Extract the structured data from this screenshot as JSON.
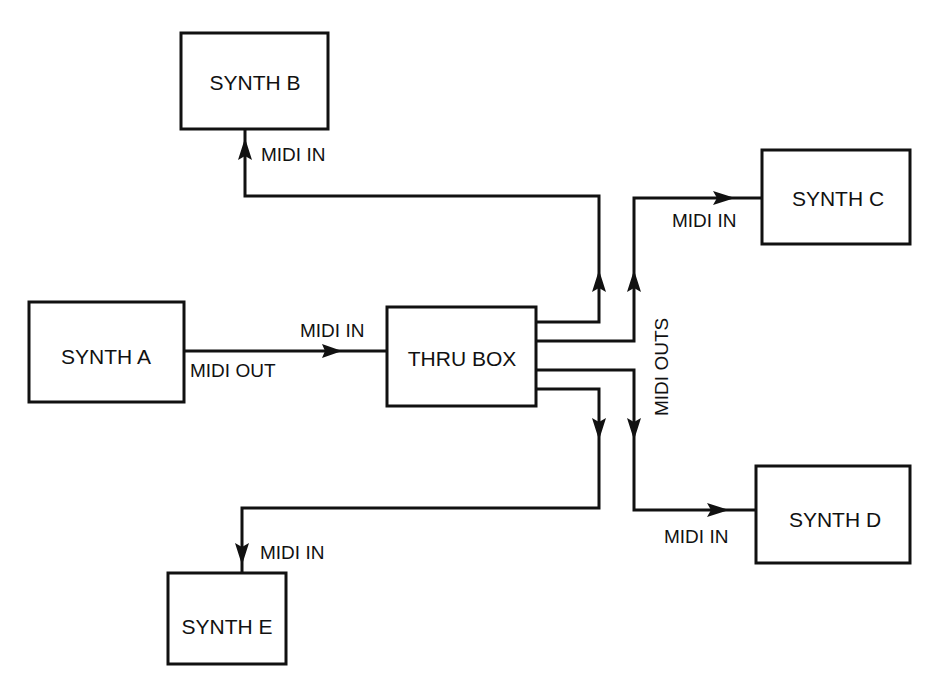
{
  "diagram": {
    "type": "block-diagram",
    "nodes": [
      {
        "id": "synth_a",
        "label": "SYNTH A"
      },
      {
        "id": "synth_b",
        "label": "SYNTH B"
      },
      {
        "id": "synth_c",
        "label": "SYNTH C"
      },
      {
        "id": "synth_d",
        "label": "SYNTH D"
      },
      {
        "id": "synth_e",
        "label": "SYNTH E"
      },
      {
        "id": "thru_box",
        "label": "THRU BOX"
      }
    ],
    "labels": {
      "midi_out": "MIDI OUT",
      "midi_in_thru": "MIDI IN",
      "midi_in_b": "MIDI IN",
      "midi_in_c": "MIDI IN",
      "midi_in_d": "MIDI IN",
      "midi_in_e": "MIDI IN",
      "midi_outs": "MIDI OUTS"
    },
    "edges": [
      {
        "from": "synth_a",
        "to": "thru_box",
        "from_port": "MIDI OUT",
        "to_port": "MIDI IN"
      },
      {
        "from": "thru_box",
        "to": "synth_b",
        "from_port": "MIDI OUTS",
        "to_port": "MIDI IN"
      },
      {
        "from": "thru_box",
        "to": "synth_c",
        "from_port": "MIDI OUTS",
        "to_port": "MIDI IN"
      },
      {
        "from": "thru_box",
        "to": "synth_d",
        "from_port": "MIDI OUTS",
        "to_port": "MIDI IN"
      },
      {
        "from": "thru_box",
        "to": "synth_e",
        "from_port": "MIDI OUTS",
        "to_port": "MIDI IN"
      }
    ],
    "colors": {
      "line": "#111111",
      "background": "#ffffff"
    }
  }
}
